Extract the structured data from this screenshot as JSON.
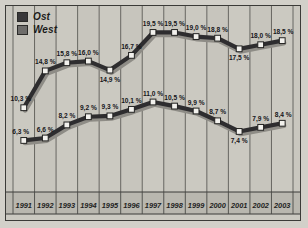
{
  "legend": {
    "position": "top-left",
    "entries": [
      {
        "label": "Ost",
        "color": "#39383a",
        "name": "legend-item-ost"
      },
      {
        "label": "West",
        "color": "#6e6d6b",
        "name": "legend-item-west"
      }
    ]
  },
  "chart_data": {
    "type": "line",
    "title": "",
    "subtitle": "",
    "xlabel": "",
    "ylabel": "",
    "grid": "vertical",
    "ylim": [
      0,
      22
    ],
    "categories": [
      "1991",
      "1992",
      "1993",
      "1994",
      "1995",
      "1996",
      "1997",
      "1998",
      "1999",
      "2000",
      "2001",
      "2002",
      "2003"
    ],
    "series": [
      {
        "name": "Ost",
        "color": "#39383a",
        "values": [
          10.3,
          14.8,
          15.8,
          16.0,
          14.9,
          16.7,
          19.5,
          19.5,
          19.0,
          18.8,
          17.5,
          18.0,
          18.5
        ],
        "labels": [
          "10,3 %",
          "14,8 %",
          "15,8 %",
          "16,0 %",
          "14,9 %",
          "16,7 %",
          "19,5 %",
          "19,5 %",
          "19,0 %",
          "18,8 %",
          "17,5 %",
          "18,0 %",
          "18,5 %"
        ]
      },
      {
        "name": "West",
        "color": "#6e6d6b",
        "values": [
          6.3,
          6.6,
          8.2,
          9.2,
          9.3,
          10.1,
          11.0,
          10.5,
          9.9,
          8.7,
          7.4,
          7.9,
          8.4
        ],
        "labels": [
          "6,3 %",
          "6,6 %",
          "8,2 %",
          "9,2 %",
          "9,3 %",
          "10,1 %",
          "11,0 %",
          "10,5 %",
          "9,9 %",
          "8,7 %",
          "7,4 %",
          "7,9 %",
          "8,4 %"
        ]
      }
    ]
  }
}
